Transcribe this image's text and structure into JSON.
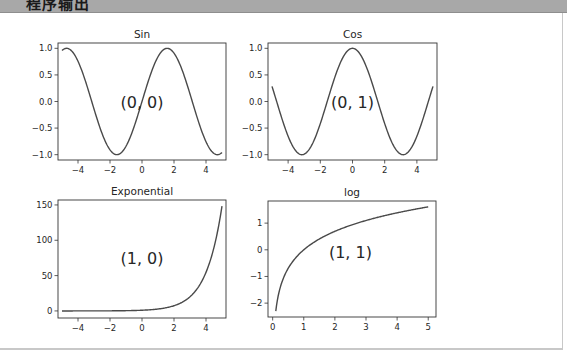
{
  "window": {
    "title": "程序输出",
    "colors": {
      "header": "#a8a8a8",
      "line": "#4a4a4a",
      "text": "#262626"
    }
  },
  "chart_data": [
    {
      "type": "line",
      "title": "Sin",
      "annotation": "(0, 0)",
      "annotation_xy": [
        0,
        0
      ],
      "function": "sin(x)",
      "x": [
        -5,
        -4,
        -3,
        -2,
        -1.5708,
        -1,
        0,
        1,
        1.5708,
        2,
        3,
        4,
        5
      ],
      "y": [
        0.959,
        0.757,
        -0.141,
        -0.909,
        -1.0,
        -0.841,
        0.0,
        0.841,
        1.0,
        0.909,
        0.141,
        -0.757,
        -0.959
      ],
      "xlim": [
        -5.25,
        5.25
      ],
      "ylim": [
        -1.1,
        1.1
      ],
      "xticks": [
        "−4",
        "−2",
        "0",
        "2",
        "4"
      ],
      "xtick_values": [
        -4,
        -2,
        0,
        2,
        4
      ],
      "yticks": [
        "1.0",
        "0.5",
        "0.0",
        "−0.5",
        "−1.0"
      ],
      "ytick_values": [
        1.0,
        0.5,
        0.0,
        -0.5,
        -1.0
      ],
      "xlabel": "",
      "ylabel": "",
      "grid": false,
      "box": [
        58,
        43,
        226,
        160
      ]
    },
    {
      "type": "line",
      "title": "Cos",
      "annotation": "(0, 1)",
      "annotation_xy": [
        0,
        0
      ],
      "function": "cos(x)",
      "x": [
        -5,
        -4,
        -3.1416,
        -3,
        -2,
        -1,
        0,
        1,
        2,
        3,
        3.1416,
        4,
        5
      ],
      "y": [
        0.284,
        -0.654,
        -1.0,
        -0.99,
        -0.416,
        0.54,
        1.0,
        0.54,
        -0.416,
        -0.99,
        -1.0,
        -0.654,
        0.284
      ],
      "xlim": [
        -5.25,
        5.25
      ],
      "ylim": [
        -1.1,
        1.1
      ],
      "xticks": [
        "−4",
        "−2",
        "0",
        "2",
        "4"
      ],
      "xtick_values": [
        -4,
        -2,
        0,
        2,
        4
      ],
      "yticks": [
        "1.0",
        "0.5",
        "0.0",
        "−0.5",
        "−1.0"
      ],
      "ytick_values": [
        1.0,
        0.5,
        0.0,
        -0.5,
        -1.0
      ],
      "xlabel": "",
      "ylabel": "",
      "grid": false,
      "box": [
        268,
        43,
        437,
        160
      ]
    },
    {
      "type": "line",
      "title": "Exponential",
      "annotation": "(1, 0)",
      "annotation_xy": [
        0,
        75
      ],
      "function": "exp(x)",
      "x": [
        -5,
        -4,
        -3,
        -2,
        -1,
        0,
        1,
        2,
        3,
        4,
        5
      ],
      "y": [
        0.007,
        0.018,
        0.05,
        0.135,
        0.368,
        1.0,
        2.718,
        7.389,
        20.09,
        54.6,
        148.41
      ],
      "xlim": [
        -5.25,
        5.25
      ],
      "ylim": [
        -10,
        157
      ],
      "xticks": [
        "−4",
        "−2",
        "0",
        "2",
        "4"
      ],
      "xtick_values": [
        -4,
        -2,
        0,
        2,
        4
      ],
      "yticks": [
        "150",
        "100",
        "50",
        "0"
      ],
      "ytick_values": [
        150,
        100,
        50,
        0
      ],
      "xlabel": "",
      "ylabel": "",
      "grid": false,
      "box": [
        58,
        200,
        226,
        318
      ]
    },
    {
      "type": "line",
      "title": "log",
      "annotation": "(1, 1)",
      "annotation_xy": [
        2.5,
        -0.1
      ],
      "function": "ln(x)",
      "x": [
        0.1,
        0.3,
        0.5,
        1,
        1.5,
        2,
        2.5,
        3,
        3.5,
        4,
        4.5,
        5
      ],
      "y": [
        -2.303,
        -1.204,
        -0.693,
        0.0,
        0.405,
        0.693,
        0.916,
        1.099,
        1.253,
        1.386,
        1.504,
        1.609
      ],
      "xlim": [
        -0.15,
        5.25
      ],
      "ylim": [
        -2.52,
        1.83
      ],
      "xticks": [
        "0",
        "1",
        "2",
        "3",
        "4",
        "5"
      ],
      "xtick_values": [
        0,
        1,
        2,
        3,
        4,
        5
      ],
      "yticks": [
        "1",
        "0",
        "−1",
        "−2"
      ],
      "ytick_values": [
        1,
        0,
        -1,
        -2
      ],
      "xlabel": "",
      "ylabel": "",
      "grid": false,
      "box": [
        268,
        201,
        436,
        317
      ]
    }
  ]
}
